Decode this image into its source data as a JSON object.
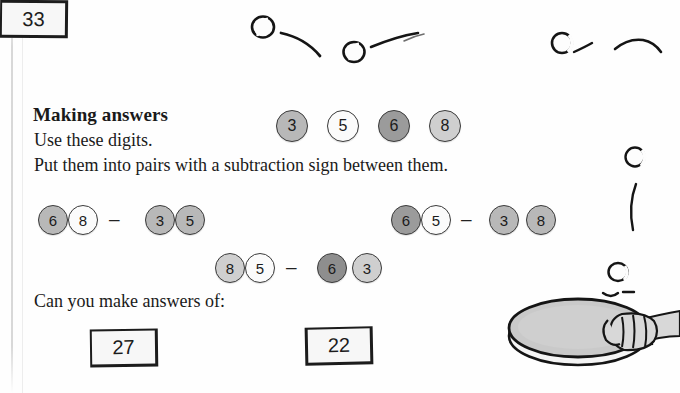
{
  "page": {
    "heading": "Making answers",
    "instruction_1": "Use these digits.",
    "instruction_2": "Put them into pairs with a subtraction sign between them.",
    "question": "Can you make answers of:"
  },
  "digit_bank": {
    "label": "available digits",
    "tokens": [
      {
        "value": "3",
        "shade": "mid"
      },
      {
        "value": "5",
        "shade": "white"
      },
      {
        "value": "6",
        "shade": "dark"
      },
      {
        "value": "8",
        "shade": "light"
      }
    ]
  },
  "minus_sign": "–",
  "examples": [
    {
      "name": "example-left",
      "tokens": [
        {
          "value": "6",
          "shade": "mid"
        },
        {
          "value": "8",
          "shade": "white"
        }
      ],
      "tokens_right": [
        {
          "value": "3",
          "shade": "mid"
        },
        {
          "value": "5",
          "shade": "mid"
        }
      ]
    },
    {
      "name": "example-right",
      "tokens": [
        {
          "value": "6",
          "shade": "dark"
        },
        {
          "value": "5",
          "shade": "white"
        }
      ],
      "tokens_right": [
        {
          "value": "3",
          "shade": "mid"
        },
        {
          "value": "8",
          "shade": "mid"
        }
      ]
    },
    {
      "name": "example-centre",
      "tokens": [
        {
          "value": "8",
          "shade": "light"
        },
        {
          "value": "5",
          "shade": "white"
        }
      ],
      "tokens_right": [
        {
          "value": "6",
          "shade": "darker"
        },
        {
          "value": "3",
          "shade": "light"
        }
      ]
    }
  ],
  "answers": [
    {
      "value": "27"
    },
    {
      "value": "33"
    },
    {
      "value": "22"
    }
  ],
  "illustration": {
    "name": "table-tennis-doodles",
    "items": [
      "ping-pong-ball-icon",
      "ball-motion-trail-icon",
      "table-tennis-paddle-icon",
      "hand-icon",
      "forearm-icon"
    ]
  },
  "colors": {
    "ink": "#1a1a1a",
    "paper": "#fefefe",
    "token_outline": "#3b3b3b",
    "paddle_face": "#c9c9c9",
    "skin": "#d8d8d8"
  }
}
